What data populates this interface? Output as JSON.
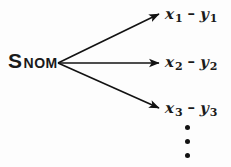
{
  "diagram": {
    "background_color": "#fdfdfd",
    "ink_color": "#1a1a1a",
    "source_node": {
      "main": "S",
      "subscript": "NOM",
      "full_text": "S NOM"
    },
    "branches": [
      {
        "left": {
          "variable": "x",
          "index": "1"
        },
        "operator": "–",
        "right": {
          "variable": "y",
          "index": "1"
        },
        "full_text": "x1 – y1"
      },
      {
        "left": {
          "variable": "x",
          "index": "2"
        },
        "operator": "–",
        "right": {
          "variable": "y",
          "index": "2"
        },
        "full_text": "x2 – y2"
      },
      {
        "left": {
          "variable": "x",
          "index": "3"
        },
        "operator": "–",
        "right": {
          "variable": "y",
          "index": "3"
        },
        "full_text": "x3 – y3"
      }
    ],
    "continuation": {
      "symbol": "⋮",
      "dot_count": 3
    }
  }
}
